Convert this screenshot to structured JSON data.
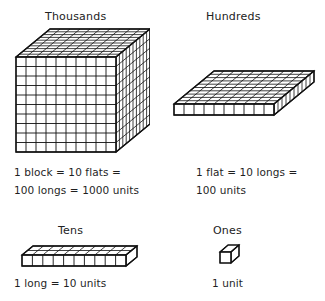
{
  "diagram": {
    "title_semantics": "base-ten-place-value-blocks",
    "groups": [
      {
        "id": "thousands",
        "heading": "Thousands",
        "shape": "cube",
        "shape_name": "block",
        "dimensions_units": [
          10,
          10,
          10
        ],
        "caption_lines": [
          "1 block   =  10 flats =",
          "100 longs = 1000 units"
        ]
      },
      {
        "id": "hundreds",
        "heading": "Hundreds",
        "shape": "flat",
        "shape_name": "flat",
        "dimensions_units": [
          10,
          10,
          1
        ],
        "caption_lines": [
          "1 flat  =  10 longs =",
          "100 units"
        ]
      },
      {
        "id": "tens",
        "heading": "Tens",
        "shape": "long",
        "shape_name": "long",
        "dimensions_units": [
          10,
          1,
          1
        ],
        "caption_lines": [
          "1 long = 10 units"
        ]
      },
      {
        "id": "ones",
        "heading": "Ones",
        "shape": "unit",
        "shape_name": "unit",
        "dimensions_units": [
          1,
          1,
          1
        ],
        "caption_lines": [
          "1 unit"
        ]
      }
    ]
  },
  "colors": {
    "background": "#ffffff",
    "ink": "#111111",
    "text": "#1f1f1f"
  }
}
